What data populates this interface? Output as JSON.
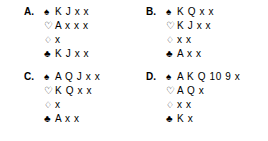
{
  "figure": {
    "type": "bridge-hand-quiz",
    "background_color": "#ffffff",
    "text_color": "#000000"
  },
  "suit_symbols": {
    "spade": "♠",
    "heart": "♡",
    "diamond": "♢",
    "club": "♣"
  },
  "hands": [
    {
      "label": "A.",
      "spades": "K J x x",
      "hearts": "A x x x",
      "diamonds": "x",
      "clubs": "K J x x"
    },
    {
      "label": "B.",
      "spades": "K Q x x",
      "hearts": "K J x x",
      "diamonds": "x x",
      "clubs": "A x x"
    },
    {
      "label": "C.",
      "spades": "A Q J x x",
      "hearts": "K Q x x",
      "diamonds": "x",
      "clubs": "A x x"
    },
    {
      "label": "D.",
      "spades": "A K Q 10 9 x",
      "hearts": "A Q x",
      "diamonds": "x x",
      "clubs": "K x"
    }
  ]
}
